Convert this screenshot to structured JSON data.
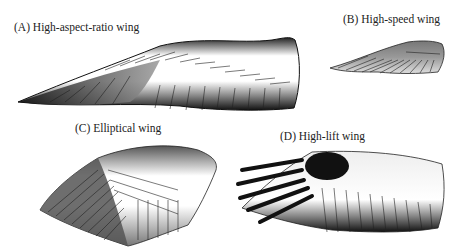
{
  "figure": {
    "panels": [
      {
        "id": "A",
        "label": "(A)  High-aspect-ratio wing",
        "wing_type": "high-aspect-ratio"
      },
      {
        "id": "B",
        "label": "(B)  High-speed wing",
        "wing_type": "high-speed"
      },
      {
        "id": "C",
        "label": "(C)  Elliptical wing",
        "wing_type": "elliptical"
      },
      {
        "id": "D",
        "label": "(D)  High-lift wing",
        "wing_type": "high-lift"
      }
    ]
  }
}
